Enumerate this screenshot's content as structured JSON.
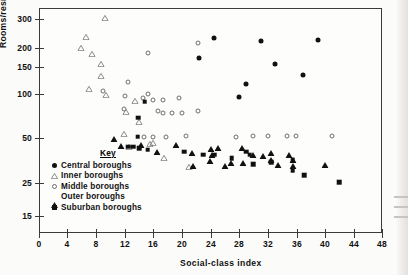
{
  "chart_data": {
    "type": "scatter",
    "title": "",
    "xlabel": "Social-class index",
    "ylabel": "Rooms/residential acre (log scale)",
    "yscale": "log",
    "xlim": [
      0,
      50
    ],
    "ylim": [
      13,
      340
    ],
    "xticks": [
      0,
      4,
      8,
      12,
      16,
      20,
      24,
      28,
      32,
      36,
      40,
      44,
      48
    ],
    "yticks": [
      15,
      25,
      50,
      100,
      150,
      200,
      300
    ],
    "grid": false,
    "legend_position": "inside-lower-left",
    "legend_title": "Key",
    "series": [
      {
        "name": "Central boroughs",
        "marker": "filled-circle",
        "points": [
          [
            24.5,
            225
          ],
          [
            31.0,
            215
          ],
          [
            29.0,
            112
          ],
          [
            22.4,
            167
          ],
          [
            33.0,
            152
          ],
          [
            37.0,
            128
          ],
          [
            39.0,
            218
          ],
          [
            28.0,
            92
          ]
        ]
      },
      {
        "name": "Inner boroughs",
        "marker": "open-triangle",
        "points": [
          [
            9.2,
            306
          ],
          [
            6.6,
            250
          ],
          [
            5.9,
            232
          ],
          [
            7.4,
            232
          ],
          [
            8.6,
            218
          ],
          [
            8.7,
            198
          ],
          [
            7.0,
            178
          ],
          [
            9.3,
            178
          ],
          [
            13.4,
            178
          ],
          [
            12.2,
            166
          ],
          [
            14.0,
            155
          ],
          [
            11.9,
            143
          ],
          [
            12.6,
            128
          ],
          [
            15.5,
            148
          ],
          [
            16.0,
            163
          ],
          [
            17.5,
            143
          ],
          [
            21.0,
            136
          ]
        ]
      },
      {
        "name": "Middle boroughs",
        "marker": "open-circle",
        "points": [
          [
            9.0,
            101
          ],
          [
            15.3,
            180
          ],
          [
            22.3,
            208
          ],
          [
            12.4,
            116
          ],
          [
            12.0,
            93
          ],
          [
            14.5,
            90
          ],
          [
            15.2,
            96
          ],
          [
            16.0,
            88
          ],
          [
            17.3,
            88
          ],
          [
            19.6,
            90
          ],
          [
            11.9,
            76
          ],
          [
            16.7,
            74
          ],
          [
            17.3,
            72
          ],
          [
            18.6,
            72
          ],
          [
            20.0,
            72
          ],
          [
            22.2,
            74
          ],
          [
            14.7,
            50
          ],
          [
            16.0,
            50
          ],
          [
            17.8,
            50
          ],
          [
            20.5,
            51
          ],
          [
            27.5,
            50
          ],
          [
            30.0,
            51
          ],
          [
            32.0,
            51
          ],
          [
            34.7,
            51
          ],
          [
            36.0,
            51
          ],
          [
            41.0,
            51
          ]
        ]
      },
      {
        "name": "Outer boroughs",
        "marker": "filled-triangle",
        "points": [
          [
            10.5,
            55
          ],
          [
            11.5,
            49
          ],
          [
            14.2,
            50
          ],
          [
            16.5,
            45
          ],
          [
            19.2,
            50
          ],
          [
            21.4,
            44
          ],
          [
            24.0,
            47
          ],
          [
            24.2,
            43
          ],
          [
            25.0,
            48
          ],
          [
            23.9,
            39
          ],
          [
            26.8,
            38
          ],
          [
            28.6,
            38
          ],
          [
            28.4,
            48
          ],
          [
            30.0,
            43
          ],
          [
            32.5,
            44
          ],
          [
            32.5,
            40
          ],
          [
            31.3,
            42
          ],
          [
            33.5,
            37
          ],
          [
            35.5,
            40
          ],
          [
            26.0,
            36
          ],
          [
            21.5,
            36
          ],
          [
            35.5,
            36
          ],
          [
            35.0,
            43
          ],
          [
            40.0,
            37
          ]
        ]
      },
      {
        "name": "Suburban boroughs",
        "marker": "filled-square",
        "points": [
          [
            14.8,
            85
          ],
          [
            13.9,
            67
          ],
          [
            13.8,
            50
          ],
          [
            12.5,
            43
          ],
          [
            13.2,
            43
          ],
          [
            14.0,
            42
          ],
          [
            15.2,
            41
          ],
          [
            20.3,
            40
          ],
          [
            23.0,
            38
          ],
          [
            24.5,
            38
          ],
          [
            27.0,
            36
          ],
          [
            29.0,
            40
          ],
          [
            29.5,
            38
          ],
          [
            30.0,
            33
          ],
          [
            32.5,
            34
          ],
          [
            35.5,
            35
          ],
          [
            35.5,
            30
          ],
          [
            37.1,
            28
          ],
          [
            42.0,
            25
          ]
        ]
      }
    ]
  },
  "axes": {
    "x": {
      "title": "Social-class index",
      "tick_labels": [
        "0",
        "4",
        "8",
        "12",
        "16",
        "20",
        "24",
        "28",
        "32",
        "36",
        "40",
        "44",
        "48"
      ],
      "tick_px": [
        39,
        67,
        96,
        125,
        153,
        182,
        211,
        239,
        268,
        297,
        325,
        354,
        382
      ]
    },
    "y": {
      "title": "Rooms/residential acre (log scale)",
      "tick_labels": [
        "300",
        "200",
        "150",
        "100",
        "50",
        "25",
        "15"
      ],
      "tick_px": [
        19,
        48,
        67,
        94,
        138,
        183,
        216
      ]
    }
  },
  "legend": {
    "title": "Key",
    "items": [
      {
        "label": "Central boroughs",
        "marker": "filled-circle"
      },
      {
        "label": "Inner boroughs",
        "marker": "open-triangle"
      },
      {
        "label": "Middle boroughs",
        "marker": "open-circle"
      },
      {
        "label": "Outer boroughs",
        "marker": "filled-triangle"
      },
      {
        "label": "Suburban boroughs",
        "marker": "filled-square"
      }
    ]
  },
  "colors": {
    "ink": "#111111",
    "frame": "#3a3a3a",
    "open_marker_stroke": "#6d6d6d",
    "paper": "#fbfbfa"
  }
}
